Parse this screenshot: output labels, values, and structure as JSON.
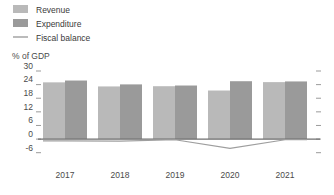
{
  "chart_data": {
    "type": "bar",
    "title": "",
    "xlabel": "",
    "ylabel": "% of GDP",
    "categories": [
      "2017",
      "2018",
      "2019",
      "2020",
      "2021"
    ],
    "ylim": [
      -6,
      30
    ],
    "yticks": [
      30,
      24,
      18,
      12,
      6,
      0,
      -6
    ],
    "ytick_labels": [
      "30",
      "24",
      "18",
      "12",
      "6",
      "0",
      "-6"
    ],
    "grid": false,
    "legend_position": "top-left",
    "series": [
      {
        "name": "Revenue",
        "kind": "bar",
        "color": "#b9b9b9",
        "values": [
          25.0,
          23.2,
          23.3,
          21.4,
          25.1
        ]
      },
      {
        "name": "Expenditure",
        "kind": "bar",
        "color": "#9a9a9a",
        "values": [
          25.8,
          24.1,
          23.6,
          25.5,
          25.4
        ]
      },
      {
        "name": "Fiscal balance",
        "kind": "line",
        "color": "#9e9e9e",
        "values": [
          -0.8,
          -0.9,
          -0.3,
          -4.1,
          -0.3
        ]
      }
    ]
  },
  "axis": {
    "ylabel": "% of GDP"
  },
  "legend": {
    "items": [
      {
        "label": "Revenue",
        "marker": "swatch",
        "color": "#b9b9b9"
      },
      {
        "label": "Expenditure",
        "marker": "swatch",
        "color": "#9a9a9a"
      },
      {
        "label": "Fiscal balance",
        "marker": "line",
        "color": "#9e9e9e"
      }
    ]
  }
}
